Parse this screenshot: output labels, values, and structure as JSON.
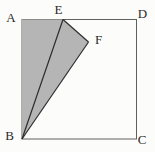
{
  "figure": {
    "colors": {
      "background": "#fcfcfb",
      "shaded_fill": "#b5b5b5",
      "segment_stroke": "#2d2d2d",
      "square_stroke": "#606060",
      "label_color": "#2a2a2a"
    },
    "points": {
      "A": [
        22,
        19.5
      ],
      "B": [
        22,
        139
      ],
      "C": [
        136.5,
        139
      ],
      "D": [
        136.5,
        19.5
      ],
      "E": [
        63,
        19.5
      ],
      "F": [
        88.5,
        42
      ]
    },
    "shaded_polygon": [
      "A",
      "E",
      "F",
      "B"
    ],
    "segments": [
      [
        "B",
        "E"
      ],
      [
        "E",
        "F"
      ],
      [
        "F",
        "B"
      ]
    ],
    "labels": {
      "A": {
        "text": "A",
        "x": 11,
        "y": 22
      },
      "B": {
        "text": "B",
        "x": 9.5,
        "y": 140
      },
      "C": {
        "text": "C",
        "x": 142,
        "y": 144
      },
      "D": {
        "text": "D",
        "x": 142.5,
        "y": 18
      },
      "E": {
        "text": "E",
        "x": 58.5,
        "y": 13.5
      },
      "F": {
        "text": "F",
        "x": 98.5,
        "y": 43.5
      }
    }
  }
}
